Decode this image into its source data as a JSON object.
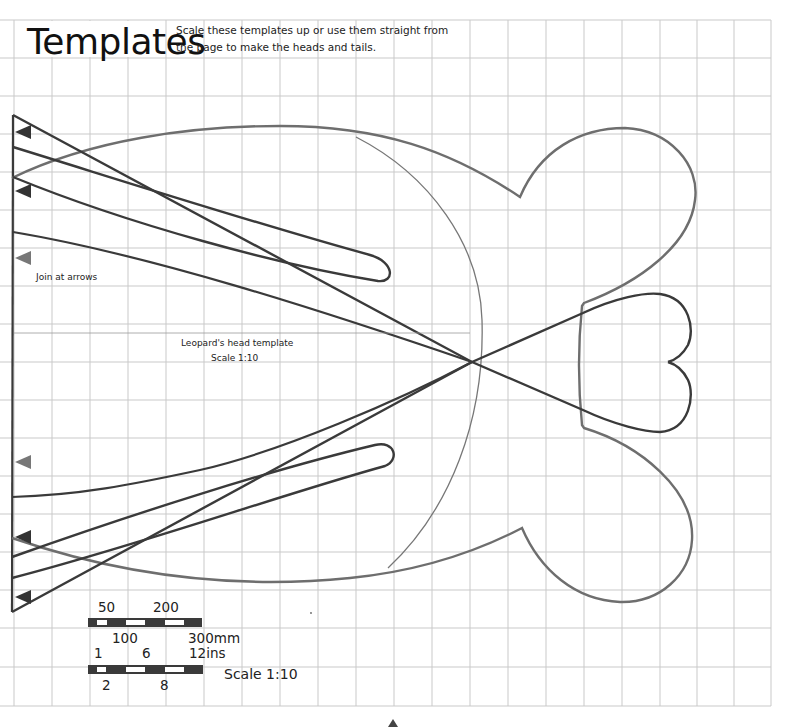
{
  "header": {
    "title": "Templates",
    "intro": "Scale these templates up or use them straight from the page to make the heads and tails."
  },
  "labels": {
    "join": "Join at arrows",
    "template_name": "Leopard's head template",
    "template_scale": "Scale 1:10"
  },
  "scale_bar": {
    "mm_top": [
      "50",
      "200"
    ],
    "mm_bottom": [
      "100",
      "300mm"
    ],
    "in_top": [
      "1",
      "6",
      "12ins"
    ],
    "in_bottom": [
      "2",
      "8"
    ],
    "label": "Scale 1:10"
  },
  "grid": {
    "cell_size_px": 38,
    "columns": 20,
    "rows": 18
  },
  "colors": {
    "grid": "#c9c9c9",
    "cut_line": "#3a3a3a",
    "ear_outline": "#6e6e6e",
    "arc": "#777777",
    "arrow_dark": "#333333",
    "arrow_gray": "#777777"
  },
  "arrows": [
    {
      "y": 132,
      "tone": "dark"
    },
    {
      "y": 191,
      "tone": "dark"
    },
    {
      "y": 258,
      "tone": "gray"
    },
    {
      "y": 462,
      "tone": "gray"
    },
    {
      "y": 537,
      "tone": "dark"
    },
    {
      "y": 597,
      "tone": "dark"
    }
  ]
}
